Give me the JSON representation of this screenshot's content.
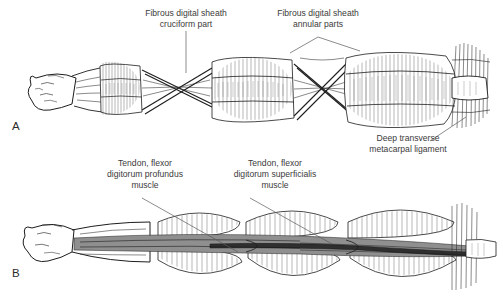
{
  "figure": {
    "background_color": "#ffffff",
    "ink_color": "#1d1d1d",
    "text_color": "#3b3b3b",
    "width": 503,
    "height": 298
  },
  "panels": [
    {
      "id": "A",
      "letter": "A",
      "description": "Intact fibrous digital sheath showing annular and cruciform parts"
    },
    {
      "id": "B",
      "letter": "B",
      "description": "Fibrous digital sheath opened to expose flexor tendons"
    }
  ],
  "annotations": [
    {
      "id": "cruciform",
      "panel": "A",
      "lines": [
        "Fibrous digital sheath",
        "cruciform part"
      ],
      "line1": "Fibrous digital sheath",
      "line2": "cruciform part",
      "leader": "vertical"
    },
    {
      "id": "annular",
      "panel": "A",
      "lines": [
        "Fibrous digital sheath",
        "annular parts"
      ],
      "line1": "Fibrous digital sheath",
      "line2": "annular parts",
      "leader": "forked"
    },
    {
      "id": "deep-transverse",
      "panel": "A",
      "lines": [
        "Deep transverse",
        "metacarpal ligament"
      ],
      "line1": "Deep transverse",
      "line2": "metacarpal ligament",
      "leader": "diagonal-up-right"
    },
    {
      "id": "profundus",
      "panel": "B",
      "lines": [
        "Tendon, flexor",
        "digitorum profundus",
        "muscle"
      ],
      "line1": "Tendon, flexor",
      "line2": "digitorum profundus",
      "line3": "muscle",
      "leader": "diagonal-down-right"
    },
    {
      "id": "superficialis",
      "panel": "B",
      "lines": [
        "Tendon, flexor",
        "digitorum superficialis",
        "muscle"
      ],
      "line1": "Tendon, flexor",
      "line2": "digitorum superficialis",
      "line3": "muscle",
      "leader": "diagonal-down-right"
    }
  ]
}
